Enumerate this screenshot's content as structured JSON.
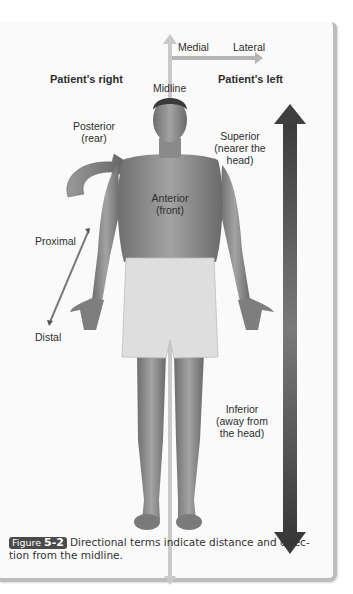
{
  "figure": {
    "labels": {
      "medial": "Medial",
      "lateral": "Lateral",
      "patients_right": "Patient's right",
      "patients_left": "Patient's left",
      "midline": "Midline",
      "posterior_line1": "Posterior",
      "posterior_line2": "(rear)",
      "anterior_line1": "Anterior",
      "anterior_line2": "(front)",
      "superior_line1": "Superior",
      "superior_line2": "(nearer the",
      "superior_line3": "head)",
      "proximal": "Proximal",
      "distal": "Distal",
      "inferior_line1": "Inferior",
      "inferior_line2": "(away from",
      "inferior_line3": "the head)"
    },
    "caption": {
      "badge_prefix": "Figure",
      "badge_number": "5-2",
      "text": "Directional terms indicate distance and direc-tion from the midline."
    },
    "colors": {
      "midline_arrow": "#c9c9c9",
      "superior_inferior_arrow": "#4a4a4a",
      "posterior_arrow": "#8a8a8a",
      "skin": "#8e8e8e",
      "shorts": "#dcdcdc",
      "badge_bg": "#4a4a4a"
    }
  }
}
